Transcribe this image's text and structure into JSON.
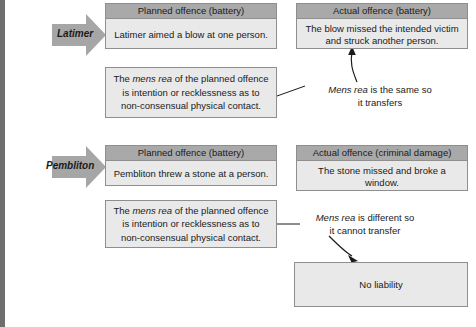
{
  "diagram": {
    "rows": [
      {
        "party": "Latimer",
        "planned": {
          "header": "Planned offence (battery)",
          "body": "Latimer aimed a blow at one person."
        },
        "actual": {
          "header": "Actual offence (battery)",
          "body": "The blow missed the intended victim and struck another person."
        },
        "mens_rea": {
          "line1_pre": "The ",
          "line1_em": "mens rea",
          "line1_post": " of the planned offence",
          "line2": "is intention or recklessness as to",
          "line3": "non-consensual physical contact."
        },
        "note": {
          "em": "Mens rea",
          "line1_post": " is the same so",
          "line2": "it transfers"
        },
        "outcome": null
      },
      {
        "party": "Pembliton",
        "planned": {
          "header": "Planned offence (battery)",
          "body": "Pembliton threw a stone at a person."
        },
        "actual": {
          "header": "Actual offence (criminal damage)",
          "body": "The stone missed and broke a window."
        },
        "mens_rea": {
          "line1_pre": "The ",
          "line1_em": "mens rea",
          "line1_post": " of the planned offence",
          "line2": "is intention or recklessness as to",
          "line3": "non-consensual physical contact."
        },
        "note": {
          "em": "Mens rea",
          "line1_post": " is different so",
          "line2": "it cannot transfer"
        },
        "outcome": {
          "label": "No liability"
        }
      }
    ],
    "colors": {
      "header_fill": "#a9a9a9",
      "body_fill": "#e9e9e9",
      "border": "#8e8e8e",
      "arrow_fill": "#a0a0a0",
      "strip": "#6e6e6e",
      "text": "#1a1a1a"
    }
  }
}
